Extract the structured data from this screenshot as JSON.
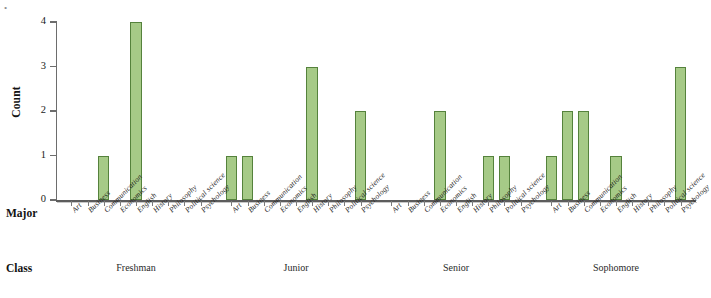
{
  "chart_data": {
    "type": "bar",
    "title": "",
    "subtitle": "",
    "xlabel": "Major",
    "ylabel": "Count",
    "ylim": [
      0,
      4
    ],
    "ytickvalues": [
      0,
      1,
      2,
      3,
      4
    ],
    "yticklabels": [
      "0",
      "1",
      "2",
      "3",
      "4"
    ],
    "grid": false,
    "legend": "none",
    "grouping": "Class",
    "categories": [
      "Art",
      "Business",
      "Communication",
      "Economics",
      "English",
      "History",
      "Philosophy",
      "Political science",
      "Psychology"
    ],
    "groups": [
      "Freshman",
      "Junior",
      "Senior",
      "Sophomore"
    ],
    "series": [
      {
        "name": "Freshman",
        "values": [
          0,
          0,
          1,
          0,
          4,
          0,
          0,
          0,
          0
        ]
      },
      {
        "name": "Junior",
        "values": [
          1,
          1,
          0,
          0,
          0,
          3,
          0,
          0,
          2
        ]
      },
      {
        "name": "Senior",
        "values": [
          0,
          0,
          0,
          2,
          0,
          0,
          1,
          1,
          0
        ]
      },
      {
        "name": "Sophomore",
        "values": [
          1,
          2,
          2,
          0,
          1,
          0,
          0,
          0,
          3
        ]
      }
    ],
    "bar_fill_color": "#a6ca87",
    "bar_edge_color": "#55823c",
    "axis_color": "#5c5c5c"
  },
  "axis": {
    "major_row_title": "Major",
    "class_row_title": "Class"
  }
}
